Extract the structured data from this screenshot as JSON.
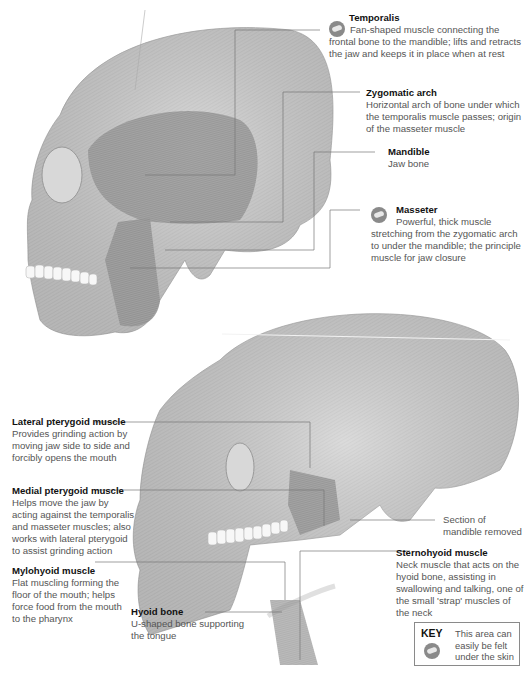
{
  "figure": {
    "labels": {
      "temporalis": {
        "title": "Temporalis",
        "desc": "Fan-shaped muscle connecting the frontal bone to the mandible; lifts and retracts the jaw and keeps it in place when at rest",
        "palpable": true
      },
      "zygomatic_arch": {
        "title": "Zygomatic arch",
        "desc": "Horizontal arch of bone under which the temporalis muscle passes; origin of the masseter muscle",
        "palpable": false
      },
      "mandible": {
        "title": "Mandible",
        "desc": "Jaw bone",
        "palpable": false
      },
      "masseter": {
        "title": "Masseter",
        "desc": "Powerful, thick muscle stretching from the zygomatic arch to under the mandible; the principle muscle for jaw closure",
        "palpable": true
      },
      "lateral_pterygoid": {
        "title": "Lateral pterygoid muscle",
        "desc": "Provides grinding action by moving jaw side to side and forcibly opens the mouth"
      },
      "medial_pterygoid": {
        "title": "Medial pterygoid muscle",
        "desc": "Helps move the jaw by acting against the temporalis and masseter muscles; also works with lateral pterygoid to assist grinding action"
      },
      "mylohyoid": {
        "title": "Mylohyoid muscle",
        "desc": "Flat muscling forming the floor of the mouth; helps force food from the mouth to the pharynx"
      },
      "hyoid_bone": {
        "title": "Hyoid bone",
        "desc": "U-shaped bone supporting the tongue"
      },
      "section_removed": {
        "title": "",
        "desc": "Section of mandible removed"
      },
      "sternohyoid": {
        "title": "Sternohyoid muscle",
        "desc": "Neck muscle that acts on the hyoid bone, assisting in swallowing and talking, one of the small 'strap' muscles of the neck"
      }
    },
    "key": {
      "title": "KEY",
      "icon": "palpable-hand-icon",
      "desc": "This area can easily be felt under the skin"
    }
  }
}
